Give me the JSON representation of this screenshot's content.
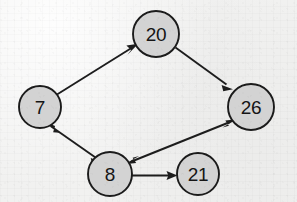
{
  "diagram": {
    "type": "node-link-diagram",
    "colors": {
      "node_fill": "#d3d3d3",
      "node_stroke": "#1b1b1b",
      "edge_stroke": "#1d1d1d",
      "label_color": "#151515",
      "background": "#f1f1f0"
    },
    "nodes": [
      {
        "id": "n7",
        "label": "7",
        "cx": 40,
        "cy": 107,
        "r": 21
      },
      {
        "id": "n20",
        "label": "20",
        "cx": 156,
        "cy": 34,
        "r": 23
      },
      {
        "id": "n26",
        "label": "26",
        "cx": 251,
        "cy": 107,
        "r": 23
      },
      {
        "id": "n8",
        "label": "8",
        "cx": 110,
        "cy": 174,
        "r": 22
      },
      {
        "id": "n21",
        "label": "21",
        "cx": 198,
        "cy": 174,
        "r": 21
      }
    ],
    "edges": [
      {
        "id": "e-7-20",
        "from": "7",
        "to": "20",
        "direction": "forward",
        "arrowheads": 1
      },
      {
        "id": "e-20-26",
        "from": "20",
        "to": "26",
        "direction": "forward",
        "arrowheads": 1
      },
      {
        "id": "e-7-8",
        "from": "7",
        "to": "8",
        "direction": "bidirectional",
        "arrowheads": 2
      },
      {
        "id": "e-8-26",
        "from": "8",
        "to": "26",
        "direction": "bidirectional",
        "arrowheads": 2
      },
      {
        "id": "e-8-21",
        "from": "8",
        "to": "21",
        "direction": "forward",
        "arrowheads": 1
      }
    ]
  }
}
